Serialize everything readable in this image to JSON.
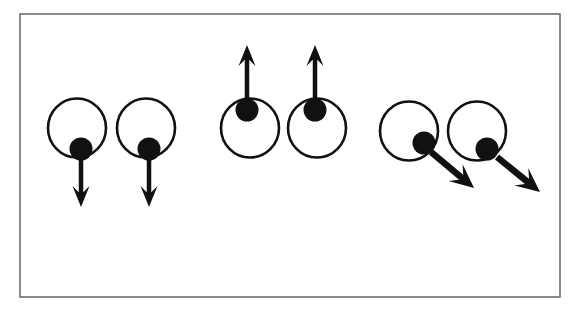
{
  "figure": {
    "background_color": "#ffffff",
    "ink_color": "#111111",
    "frame": {
      "label": "figure-border",
      "x": 20,
      "y": 14,
      "width": 540,
      "height": 283,
      "stroke_color": "#6e6e6e",
      "stroke_width": 1.6
    },
    "geometry": {
      "circle_stroke_width": 2.6,
      "circle_radius_x": 29,
      "circle_radius_y": 29.5,
      "dot_radius": 11.5
    },
    "groups": [
      {
        "name": "left-pair",
        "phase_label": "down",
        "arrow_direction": "down",
        "arrow_angle_deg": 90,
        "oscillators": [
          {
            "name": "oscillator-1",
            "circle": {
              "cx": 77,
              "cy": 128,
              "rx": 29,
              "ry": 29.5
            },
            "dot": {
              "cx": 81,
              "cy": 149,
              "r": 11.5,
              "rim_position": "bottom"
            },
            "arrow": {
              "x1": 81,
              "y1": 155,
              "x2": 81,
              "y2": 207,
              "shaft_width": 4.5,
              "head_width": 17,
              "head_length": 21
            }
          },
          {
            "name": "oscillator-2",
            "circle": {
              "cx": 146,
              "cy": 128,
              "rx": 29,
              "ry": 29.5
            },
            "dot": {
              "cx": 149,
              "cy": 149,
              "r": 11.5,
              "rim_position": "bottom"
            },
            "arrow": {
              "x1": 149,
              "y1": 155,
              "x2": 149,
              "y2": 207,
              "shaft_width": 4.5,
              "head_width": 17,
              "head_length": 21
            }
          }
        ]
      },
      {
        "name": "middle-pair",
        "phase_label": "up",
        "arrow_direction": "up",
        "arrow_angle_deg": 270,
        "oscillators": [
          {
            "name": "oscillator-3",
            "circle": {
              "cx": 250,
              "cy": 128,
              "rx": 29,
              "ry": 29.5
            },
            "dot": {
              "cx": 247,
              "cy": 110,
              "r": 11.5,
              "rim_position": "top"
            },
            "arrow": {
              "x1": 247,
              "y1": 104,
              "x2": 247,
              "y2": 45,
              "shaft_width": 4.5,
              "head_width": 17,
              "head_length": 21
            }
          },
          {
            "name": "oscillator-4",
            "circle": {
              "cx": 317,
              "cy": 128,
              "rx": 29,
              "ry": 29.5
            },
            "dot": {
              "cx": 315,
              "cy": 110,
              "r": 11.5,
              "rim_position": "top"
            },
            "arrow": {
              "x1": 315,
              "y1": 104,
              "x2": 315,
              "y2": 45,
              "shaft_width": 4.5,
              "head_width": 17,
              "head_length": 21
            }
          }
        ]
      },
      {
        "name": "right-pair",
        "phase_label": "diagonal-down-right",
        "arrow_direction": "down-right",
        "arrow_angle_deg": 42,
        "oscillators": [
          {
            "name": "oscillator-5",
            "circle": {
              "cx": 409,
              "cy": 131,
              "rx": 29,
              "ry": 29.5
            },
            "dot": {
              "cx": 424,
              "cy": 143,
              "r": 11.5,
              "rim_position": "lower-right"
            },
            "arrow": {
              "x1": 431,
              "y1": 152,
              "x2": 474,
              "y2": 188,
              "shaft_width": 6.5,
              "head_width": 22,
              "head_length": 24
            }
          },
          {
            "name": "oscillator-6",
            "circle": {
              "cx": 477,
              "cy": 131,
              "rx": 29,
              "ry": 29.5
            },
            "dot": {
              "cx": 487,
              "cy": 149,
              "r": 11.5,
              "rim_position": "lower-right"
            },
            "arrow": {
              "x1": 497,
              "y1": 157,
              "x2": 540,
              "y2": 192,
              "shaft_width": 6.5,
              "head_width": 22,
              "head_length": 24
            }
          }
        ]
      }
    ]
  }
}
